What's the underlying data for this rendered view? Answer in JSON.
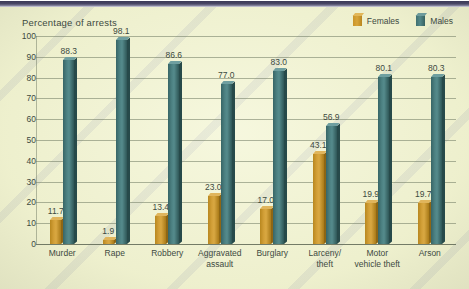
{
  "chart_data": {
    "type": "bar",
    "title": "Percentage of arrests",
    "xlabel": "",
    "ylabel": "",
    "ylim": [
      0,
      100
    ],
    "yticks": [
      0,
      10,
      20,
      30,
      40,
      50,
      60,
      70,
      80,
      90,
      100
    ],
    "grid": true,
    "legend_position": "top-right",
    "categories": [
      "Murder",
      "Rape",
      "Robbery",
      "Aggravated\nassault",
      "Burglary",
      "Larceny/\ntheft",
      "Motor\nvehicle theft",
      "Arson"
    ],
    "series": [
      {
        "name": "Females",
        "color": "#c99428",
        "values": [
          11.7,
          1.9,
          13.4,
          23.0,
          17.0,
          43.1,
          19.9,
          19.7
        ]
      },
      {
        "name": "Males",
        "color": "#46797a",
        "values": [
          88.3,
          98.1,
          86.6,
          77.0,
          83.0,
          56.9,
          80.1,
          80.3
        ]
      }
    ]
  },
  "legend": {
    "items": [
      {
        "label": "Females",
        "key": "female"
      },
      {
        "label": "Males",
        "key": "male"
      }
    ]
  }
}
